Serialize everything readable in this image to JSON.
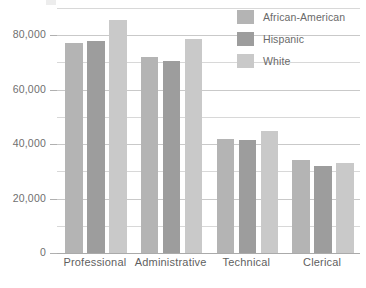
{
  "chart_data": {
    "type": "bar",
    "title": "",
    "subtitle": "",
    "xlabel": "",
    "ylabel": "",
    "categories": [
      "Professional",
      "Administrative",
      "Technical",
      "Clerical"
    ],
    "series": [
      {
        "name": "African-American",
        "color": "#b4b4b4",
        "values": [
          77000,
          72000,
          42000,
          34000
        ]
      },
      {
        "name": "Hispanic",
        "color": "#9d9d9d",
        "values": [
          78000,
          70500,
          41500,
          32000
        ]
      },
      {
        "name": "White",
        "color": "#c9c9c9",
        "values": [
          85500,
          78500,
          45000,
          33000
        ]
      }
    ],
    "ylim": [
      0,
      90000
    ],
    "yticks": [
      0,
      20000,
      40000,
      60000,
      80000
    ],
    "ytick_labels": [
      "0",
      "20,000",
      "40,000",
      "60,000",
      "80,000"
    ],
    "minor_yticks": [
      10000,
      30000,
      50000,
      70000,
      90000
    ],
    "grid": true,
    "legend_position": "top-right",
    "gridline_color": "#c9c9c9",
    "axis_color": "#aaaaaa",
    "label_color": "#6f6f6f"
  },
  "legend": {
    "items": [
      {
        "label": "African-American"
      },
      {
        "label": "Hispanic"
      },
      {
        "label": "White"
      }
    ]
  }
}
